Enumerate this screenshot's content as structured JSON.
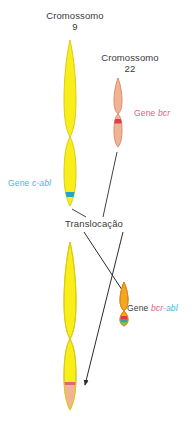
{
  "figure": {
    "title_chromosome9": "Cromossomo\n9",
    "chromosome9_name": "Cromossomo",
    "chromosome9_number": "9",
    "chromosome22_name": "Cromossomo",
    "chromosome22_number": "22",
    "translocation_label": "Translocação",
    "gene_abl_label": "Gene c-abl",
    "gene_abl_prefix": "Gene ",
    "gene_abl_italic": "c-abl",
    "gene_bcr_prefix": "Gene ",
    "gene_bcr_italic": "bcr",
    "gene_bcrabl_prefix": "Gene ",
    "gene_bcrabl_italic_bcr": "bcr-",
    "gene_bcrabl_italic_abl": "abl"
  },
  "colors": {
    "chromosome9_body": "#faee1a",
    "chromosome9_outline": "#d9cc14",
    "chromosome22_body": "#f2b394",
    "chromosome22_outline": "#d98f6e",
    "philadelphia_body": "#f5a623",
    "philadelphia_outline": "#d98c12",
    "gene_abl_band": "#1fa8c4",
    "gene_bcr_band": "#e23a4e",
    "gene_bcr_text": "#e8607f",
    "gene_abl_text": "#49b4e0",
    "label_text": "#3a3a3a",
    "arrow": "#2b2b2b",
    "derivative9_tip": "#f2b394"
  },
  "elements": {
    "arrows": [
      {
        "name": "translocation-arrow-left",
        "from": "chromosome-9-lower",
        "to": "philadelphia-chromosome"
      },
      {
        "name": "translocation-arrow-right",
        "from": "chromosome-22",
        "to": "derivative-chromosome-9"
      }
    ],
    "leader_lines": [
      {
        "name": "leader-line-chr9-translocation"
      },
      {
        "name": "leader-line-chr22-translocation"
      }
    ]
  }
}
